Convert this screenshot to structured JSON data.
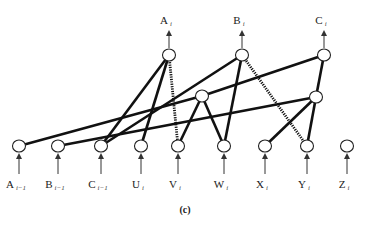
{
  "diagram": {
    "caption": "(c)",
    "colors": {
      "edge": "#111111",
      "node_fill": "#ffffff",
      "node_stroke": "#222222",
      "arrow": "#333333"
    },
    "outputs": [
      {
        "id": "A_i",
        "base": "A",
        "sub": "i",
        "x": 169,
        "y": 55
      },
      {
        "id": "B_i",
        "base": "B",
        "sub": "i",
        "x": 242,
        "y": 55
      },
      {
        "id": "C_i",
        "base": "C",
        "sub": "i",
        "x": 324,
        "y": 55
      }
    ],
    "hidden": [
      {
        "id": "H1",
        "x": 202,
        "y": 96
      },
      {
        "id": "H2",
        "x": 316,
        "y": 97
      }
    ],
    "inputs": [
      {
        "id": "A_i-1",
        "base": "A",
        "sub": "i−1",
        "x": 19,
        "y": 146
      },
      {
        "id": "B_i-1",
        "base": "B",
        "sub": "i−1",
        "x": 58,
        "y": 146
      },
      {
        "id": "C_i-1",
        "base": "C",
        "sub": "i−1",
        "x": 101,
        "y": 146
      },
      {
        "id": "U_i",
        "base": "U",
        "sub": "i",
        "x": 141,
        "y": 146
      },
      {
        "id": "V_i",
        "base": "V",
        "sub": "i",
        "x": 178,
        "y": 146
      },
      {
        "id": "W_i",
        "base": "W",
        "sub": "i",
        "x": 224,
        "y": 146
      },
      {
        "id": "X_i",
        "base": "X",
        "sub": "i",
        "x": 265,
        "y": 146
      },
      {
        "id": "Y_i",
        "base": "Y",
        "sub": "i",
        "x": 307,
        "y": 146
      },
      {
        "id": "Z_i",
        "base": "Z",
        "sub": "i",
        "x": 347,
        "y": 146
      }
    ],
    "edges": [
      {
        "from": "A_i",
        "to": "C_i-1",
        "style": "solid"
      },
      {
        "from": "A_i",
        "to": "U_i",
        "style": "solid"
      },
      {
        "from": "A_i",
        "to": "V_i",
        "style": "dotted"
      },
      {
        "from": "B_i",
        "to": "C_i-1",
        "style": "solid"
      },
      {
        "from": "B_i",
        "to": "W_i",
        "style": "solid"
      },
      {
        "from": "B_i",
        "to": "Y_i",
        "style": "dotted"
      },
      {
        "from": "C_i",
        "to": "H1",
        "style": "solid"
      },
      {
        "from": "C_i",
        "to": "H2",
        "style": "solid"
      },
      {
        "from": "H1",
        "to": "A_i-1",
        "style": "solid"
      },
      {
        "from": "H1",
        "to": "V_i",
        "style": "solid"
      },
      {
        "from": "H1",
        "to": "W_i",
        "style": "solid"
      },
      {
        "from": "H2",
        "to": "B_i-1",
        "style": "solid"
      },
      {
        "from": "H2",
        "to": "X_i",
        "style": "solid"
      },
      {
        "from": "H2",
        "to": "Y_i",
        "style": "solid"
      }
    ]
  }
}
